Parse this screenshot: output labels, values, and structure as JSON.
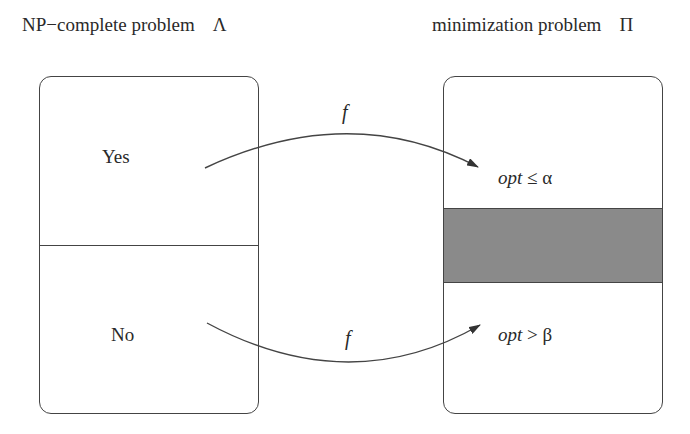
{
  "diagram": {
    "left": {
      "title": "NP−complete problem",
      "symbol": "Λ",
      "regions": [
        {
          "label": "Yes"
        },
        {
          "label": "No"
        }
      ]
    },
    "right": {
      "title": "minimization problem",
      "symbol": "Π",
      "regions": [
        {
          "prefix": "opt",
          "relation": " ≤ α"
        },
        {
          "label": "",
          "fill": "#8a8a8a"
        },
        {
          "prefix": "opt",
          "relation": " > β"
        }
      ]
    },
    "arrows": [
      {
        "from": "Yes",
        "to": "opt ≤ α",
        "label": "f"
      },
      {
        "from": "No",
        "to": "opt > β",
        "label": "f"
      }
    ],
    "colors": {
      "line": "#444444",
      "gap_band": "#8a8a8a",
      "background": "#ffffff"
    }
  }
}
